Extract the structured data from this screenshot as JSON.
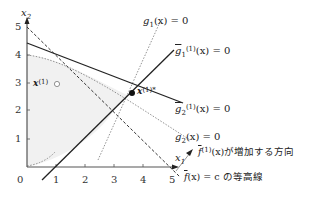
{
  "axes": {
    "x_label": "x",
    "x_sub": "1",
    "y_label": "x",
    "y_sub": "2",
    "origin": "0",
    "x_ticks": [
      "1",
      "2",
      "3",
      "4",
      "5"
    ],
    "y_ticks": [
      "1",
      "2",
      "3",
      "4",
      "5"
    ]
  },
  "labels": {
    "g1": {
      "func": "g",
      "sub": "1",
      "arg": "(x) = 0"
    },
    "g1_tilde": {
      "func": "g",
      "sub": "1",
      "sup": "(1)",
      "arg": "(x) = 0"
    },
    "g2_tilde": {
      "func": "g",
      "sub": "2",
      "sup": "(1)",
      "arg": "(x) = 0"
    },
    "g2": {
      "func": "g",
      "sub": "2",
      "arg": "(x) = 0"
    },
    "f_dir": {
      "func": "f",
      "sup": "(1)",
      "arg": "(x)",
      "text": "が増加する方向"
    },
    "f_contour": {
      "func": "f",
      "arg": "(x) = c",
      "text": "の等高線"
    },
    "x1_point": {
      "name": "x",
      "sup": "(1)"
    },
    "x1_star": {
      "name": "x",
      "sup": "(1)*"
    }
  },
  "colors": {
    "feasible_fill": "#f2f2f2",
    "line": "#222222",
    "dotted": "#666666",
    "arrow": "#999999"
  }
}
